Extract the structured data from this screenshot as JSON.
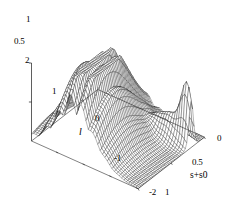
{
  "figure": {
    "kind": "surface-plot-3d",
    "background_color": "#ffffff",
    "line_color": "#1a1a1a",
    "fill_color": "#ffffff"
  },
  "axes": {
    "vertical": {
      "name": "",
      "ticks": [
        {
          "label": "1",
          "value": 1.0,
          "x": 26,
          "y": 19
        },
        {
          "label": "0.5",
          "value": 0.5,
          "x": 18,
          "y": 41
        }
      ],
      "range": [
        0,
        1
      ]
    },
    "depth": {
      "name": "l",
      "name_x": 79,
      "name_y": 132,
      "ticks": [
        {
          "label": "2",
          "value": 2,
          "x": 27,
          "y": 60
        },
        {
          "label": "1",
          "value": 1,
          "x": 53,
          "y": 91
        },
        {
          "label": "0",
          "value": 0,
          "x": 96,
          "y": 118
        },
        {
          "label": "-1",
          "value": -1,
          "x": 117,
          "y": 158
        },
        {
          "label": "-2",
          "value": -2,
          "x": 151,
          "y": 192
        }
      ],
      "range": [
        -2,
        2
      ]
    },
    "horizontal": {
      "name": "s+s0",
      "name_x": 190,
      "name_y": 175,
      "ticks": [
        {
          "label": "1",
          "value": 1.0,
          "x": 166,
          "y": 192
        },
        {
          "label": "0.5",
          "value": 0.5,
          "x": 194,
          "y": 161
        },
        {
          "label": "0",
          "value": 0.0,
          "x": 218,
          "y": 138
        }
      ],
      "range": [
        0,
        1
      ]
    }
  },
  "chart_data": {
    "type": "surface",
    "title": "",
    "xlabel": "s+s0",
    "ylabel": "l",
    "zlabel": "",
    "xlim": [
      0,
      1
    ],
    "ylim": [
      -2,
      2
    ],
    "zlim": [
      0,
      1
    ],
    "grid": false,
    "legend": null,
    "mesh": {
      "x_samples": 46,
      "y_samples": 46,
      "description": "Oscillatory surface: a broad smooth dome centred near the rear of the l-axis, a train of decaying ripples fanning toward l = 2, and a narrow tall spike at the front edge near l = -2.",
      "model": {
        "dome_center_l": 0.35,
        "dome_center_s": 0.33,
        "dome_width_l": 1.05,
        "dome_width_s": 0.5,
        "dome_amplitude": 0.96,
        "ripple_frequency": 13.5,
        "ripple_decay": 1.25,
        "ripple_amplitude": 0.62,
        "spike_l": -1.85,
        "spike_s": 0.8,
        "spike_width": 0.045,
        "spike_amplitude": 0.72
      }
    },
    "annotations": []
  }
}
